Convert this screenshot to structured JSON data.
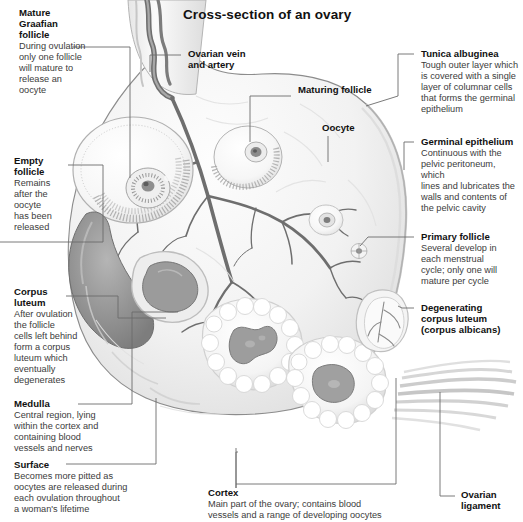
{
  "title": "Cross-section of an ovary",
  "colors": {
    "ink": "#1a1a1a",
    "body_text": "#3b3b3b",
    "leader": "#6b6b6b",
    "tissue_light": "#f3f3f3",
    "tissue_mid": "#d8d8d8",
    "tissue_dark": "#8d8d8d",
    "vessel": "#5c5c5c",
    "background": "#ffffff"
  },
  "labels": [
    {
      "id": "mature-graafian-follicle",
      "heading": "Mature\nGraafian\nfollicle",
      "body": "During ovulation\nonly one follicle\nwill mature to\nrelease an\noocyte"
    },
    {
      "id": "empty-follicle",
      "heading": "Empty\nfollicle",
      "body": "Remains\nafter the\noocyte\nhas been\nreleased"
    },
    {
      "id": "corpus-luteum",
      "heading": "Corpus\nluteum",
      "body": "After ovulation\nthe follicle\ncells left behind\nform a corpus\nluteum which\neventually\ndegenerates"
    },
    {
      "id": "medulla",
      "heading": "Medulla",
      "body": "Central region, lying\nwithin the cortex and\ncontaining blood\nvessels and nerves"
    },
    {
      "id": "surface",
      "heading": "Surface",
      "body": "Becomes more pitted as\noocytes are released during\neach ovulation throughout\na woman's lifetime"
    },
    {
      "id": "ovarian-vein-and-artery",
      "heading": "Ovarian vein\nand artery",
      "body": ""
    },
    {
      "id": "maturing-follicle",
      "heading": "Maturing follicle",
      "body": ""
    },
    {
      "id": "oocyte",
      "heading": "Oocyte",
      "body": ""
    },
    {
      "id": "tunica-albuginea",
      "heading": "Tunica albuginea",
      "body": "Tough outer layer which\nis covered with a single\nlayer of columnar cells\nthat forms the germinal\nepithelium"
    },
    {
      "id": "germinal-epithelium",
      "heading": "Germinal epithelium",
      "body": "Continuous with the\npelvic peritoneum, which\nlines and lubricates the\nwalls and contents of\nthe pelvic cavity"
    },
    {
      "id": "primary-follicle",
      "heading": "Primary follicle",
      "body": "Several develop in\neach menstrual\ncycle; only one will\nmature per cycle"
    },
    {
      "id": "degenerating-corpus-luteum",
      "heading": "Degenerating\ncorpus luteum\n(corpus albicans)",
      "body": ""
    },
    {
      "id": "cortex",
      "heading": "Cortex",
      "body": "Main part of the ovary; contains blood\nvessels and a range of developing oocytes"
    },
    {
      "id": "ovarian-ligament",
      "heading": "Ovarian\nligament",
      "body": ""
    }
  ]
}
